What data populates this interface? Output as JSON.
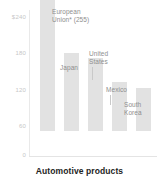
{
  "chart_data": {
    "type": "bar",
    "title": "Automotive products",
    "xlabel": "",
    "ylabel": "",
    "ylim": [
      0,
      240
    ],
    "grid": false,
    "legend": "none",
    "axis_currency_prefix": "$",
    "categories": [
      "European Union*",
      "Japan",
      "United States",
      "Mexico",
      "South Korea"
    ],
    "values": [
      255,
      135,
      127,
      85,
      75
    ],
    "ytick_labels": [
      "$240",
      "180",
      "120",
      "60",
      "0"
    ],
    "ytick_values": [
      240,
      180,
      120,
      60,
      0
    ],
    "annotations": [
      {
        "label": "European Union* (255)",
        "line1": "European",
        "line2": "Union* (255)",
        "value": 255,
        "leader": false
      },
      {
        "label": "Japan",
        "line1": "Japan",
        "line2": "",
        "value": 135,
        "leader": false
      },
      {
        "label": "United States",
        "line1": "United",
        "line2": "States",
        "value": 127,
        "leader": true
      },
      {
        "label": "Mexico",
        "line1": "Mexico",
        "line2": "",
        "value": 85,
        "leader": true
      },
      {
        "label": "South Korea",
        "line1": "South",
        "line2": "Korea",
        "value": 75,
        "leader": false
      }
    ],
    "footnote_marker": "*"
  },
  "colors": {
    "bar": "#e2e2e2",
    "tick_text": "#c7c7c7",
    "label_text": "#8e8e8e",
    "title_text": "#232323",
    "axis_line": "#e9e9e9",
    "background": "#ffffff"
  }
}
